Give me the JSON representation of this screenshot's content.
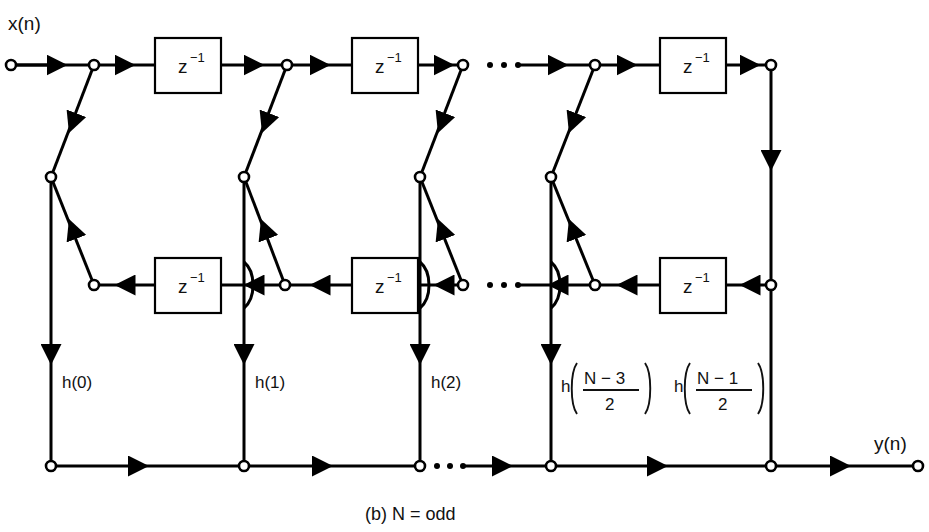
{
  "figure": {
    "caption": "(b) N = odd",
    "input_label": "x(n)",
    "output_label": "y(n)",
    "delay_base": "z",
    "delay_exponent": "−1",
    "ellipsis": "·  ·  ·"
  },
  "delay_blocks": [
    {
      "id": "delay-top-1",
      "label_base": "z",
      "label_exp": "−1",
      "row": "top"
    },
    {
      "id": "delay-top-2",
      "label_base": "z",
      "label_exp": "−1",
      "row": "top"
    },
    {
      "id": "delay-top-3",
      "label_base": "z",
      "label_exp": "−1",
      "row": "top"
    },
    {
      "id": "delay-mid-1",
      "label_base": "z",
      "label_exp": "−1",
      "row": "middle"
    },
    {
      "id": "delay-mid-2",
      "label_base": "z",
      "label_exp": "−1",
      "row": "middle"
    },
    {
      "id": "delay-mid-3",
      "label_base": "z",
      "label_exp": "−1",
      "row": "middle"
    }
  ],
  "coefficients": [
    {
      "id": "coef-0",
      "kind": "simple",
      "text": "h(0)"
    },
    {
      "id": "coef-1",
      "kind": "simple",
      "text": "h(1)"
    },
    {
      "id": "coef-2",
      "kind": "simple",
      "text": "h(2)"
    },
    {
      "id": "coef-3",
      "kind": "fraction",
      "prefix": "h",
      "numerator": "N − 3",
      "denominator": "2"
    },
    {
      "id": "coef-4",
      "kind": "fraction",
      "prefix": "h",
      "numerator": "N − 1",
      "denominator": "2"
    }
  ],
  "colors": {
    "line": "#000000",
    "node_fill": "#ffffff",
    "background": "#ffffff",
    "text": "#111111"
  }
}
